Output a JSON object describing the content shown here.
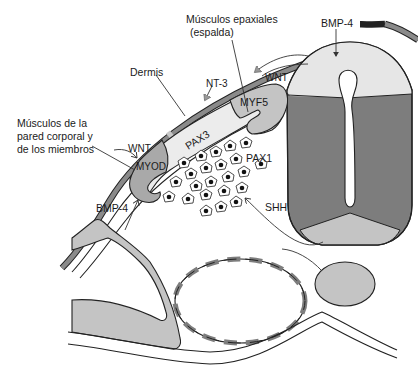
{
  "diagram": {
    "colors": {
      "dark_gray": "#7d7d7d",
      "mid_gray": "#c4c4c4",
      "light_gray": "#e6e6e6",
      "stroke": "#222222",
      "background": "#ffffff"
    },
    "labels": {
      "epaxial_line1": "Músculos epaxiales",
      "epaxial_line2": "(espalda)",
      "bmp4_top": "BMP-4",
      "wnt_top": "WNT",
      "nt3": "NT-3",
      "dermis": "Dermis",
      "myf5": "MYF5",
      "pax3": "PAX3",
      "limb_line1": "Músculos de la",
      "limb_line2": "pared corporal y",
      "limb_line3": "de los miembros",
      "wnt_left": "WNT",
      "myod": "MYOD",
      "pax1": "PAX1",
      "bmp4_bottom": "BMP-4",
      "shh": "SHH"
    },
    "structures": [
      "surface-ectoderm",
      "neural-tube",
      "notochord",
      "dermomyotome",
      "sclerotome-cells",
      "lateral-plate-mesoderm",
      "dorsal-aorta",
      "endoderm"
    ]
  }
}
